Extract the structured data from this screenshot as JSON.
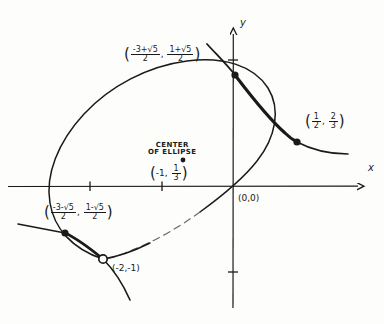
{
  "figure": {
    "kind": "hand-drawn-graph",
    "background_color": "#fdfdfc",
    "ink_color": "#1a1a1a"
  },
  "axes": {
    "x_label": "x",
    "y_label": "y",
    "origin_label": "(0,0)",
    "origin_px": {
      "x": 233,
      "y": 186
    },
    "x_ticks_px": [
      90,
      162
    ],
    "y_ticks_px": [
      60,
      272
    ],
    "x_axis_from_px": {
      "x": 8,
      "y": 186
    },
    "x_axis_to_px": {
      "x": 366,
      "y": 186
    },
    "y_axis_from_px": {
      "x": 233,
      "y": 308
    },
    "y_axis_to_px": {
      "x": 233,
      "y": 26
    }
  },
  "center_annotation": {
    "line1": "CENTER",
    "line2": "OF ELLIPSE",
    "point_label_open": "(",
    "point_x": "-1",
    "point_sep": ", ",
    "point_y_num": "1",
    "point_y_den": "3",
    "point_label_close": ")",
    "marker_px": {
      "x": 183,
      "y": 160
    }
  },
  "points": [
    {
      "id": "intersection-upper-left",
      "marker": "filled",
      "px": {
        "x": 235,
        "y": 75
      },
      "label": {
        "open": "(",
        "x_num": "-3+√5",
        "x_den": "2",
        "sep": ", ",
        "y_num": "1+√5",
        "y_den": "2",
        "close": ")"
      }
    },
    {
      "id": "intersection-right",
      "marker": "filled",
      "px": {
        "x": 297,
        "y": 142
      },
      "label": {
        "open": "(",
        "x_num": "1",
        "x_den": "2",
        "sep": ", ",
        "y_num": "2",
        "y_den": "3",
        "close": ")"
      }
    },
    {
      "id": "intersection-lower-left",
      "marker": "filled",
      "px": {
        "x": 65,
        "y": 233
      },
      "label": {
        "open": "(",
        "x_num": "-3-√5",
        "x_den": "2",
        "sep": ", ",
        "y_num": "1-√5",
        "y_den": "2",
        "close": ")"
      }
    },
    {
      "id": "removable-hole",
      "marker": "open",
      "px": {
        "x": 103,
        "y": 259
      },
      "label_text": "(-2,-1)"
    }
  ],
  "curves": [
    {
      "id": "ellipse",
      "style": "solid-with-dashed-lower-right",
      "description": "tilted ellipse centered near (-1, 1/3)"
    },
    {
      "id": "hyperbola-branch",
      "style": "solid-thickened-between-intersections",
      "description": "curve passing through the labeled intersection points"
    }
  ]
}
